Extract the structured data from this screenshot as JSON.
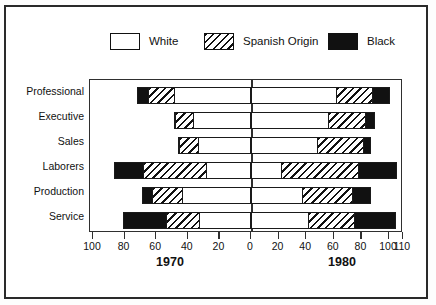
{
  "chart_data": {
    "type": "bar",
    "subtype": "horizontal-stacked-bidirectional",
    "title": "",
    "xlabel": "",
    "ylabel": "",
    "grid": false,
    "legend_position": "top",
    "legend": [
      "White",
      "Spanish Origin",
      "Black"
    ],
    "categories": [
      "Professional",
      "Executive",
      "Sales",
      "Laborers",
      "Production",
      "Service"
    ],
    "panels": [
      {
        "name": "1970",
        "direction": "left",
        "axis_ticks": [
          100,
          80,
          60,
          40,
          20,
          0
        ],
        "axis_range": [
          100,
          0
        ],
        "series": [
          {
            "name": "White",
            "values": [
              49,
              37,
              34,
              28,
              44,
              33
            ]
          },
          {
            "name": "Spanish Origin",
            "values": [
              17,
              12,
              12,
              41,
              19,
              21
            ]
          },
          {
            "name": "Black",
            "values": [
              6,
              0,
              0,
              18,
              6,
              27
            ]
          }
        ],
        "totals": [
          72,
          49,
          46,
          87,
          69,
          81
        ]
      },
      {
        "name": "1980",
        "direction": "right",
        "axis_ticks": [
          0,
          20,
          40,
          60,
          80,
          100,
          110
        ],
        "axis_range": [
          0,
          110
        ],
        "series": [
          {
            "name": "White",
            "values": [
              62,
              56,
              48,
              21,
              37,
              41
            ]
          },
          {
            "name": "Spanish Origin",
            "values": [
              26,
              27,
              34,
              57,
              37,
              34
            ]
          },
          {
            "name": "Black",
            "values": [
              13,
              7,
              5,
              28,
              13,
              30
            ]
          }
        ],
        "totals": [
          101,
          90,
          87,
          106,
          87,
          105
        ]
      }
    ]
  },
  "axis": {
    "left_tick_labels": [
      "100",
      "80",
      "60",
      "40",
      "20"
    ],
    "zero_label": "0",
    "right_tick_labels": [
      "20",
      "40",
      "60",
      "80",
      "100",
      "110"
    ],
    "decade_left": "1970",
    "decade_right": "1980"
  },
  "legend": {
    "items": [
      {
        "label": "White",
        "pattern": "white",
        "color": "#ffffff"
      },
      {
        "label": "Spanish Origin",
        "pattern": "hatch",
        "color": "#111111"
      },
      {
        "label": "Black",
        "pattern": "solid",
        "color": "#111111"
      }
    ]
  },
  "categories": [
    {
      "label": "Professional"
    },
    {
      "label": "Executive"
    },
    {
      "label": "Sales"
    },
    {
      "label": "Laborers"
    },
    {
      "label": "Production"
    },
    {
      "label": "Service"
    }
  ]
}
